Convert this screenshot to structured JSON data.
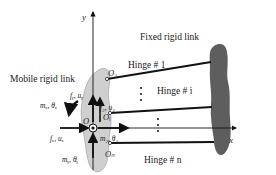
{
  "labels": {
    "mobile_link": "Mobile rigid link",
    "fixed_link": "Fixed rigid link",
    "hinge_1": "Hinge # 1",
    "hinge_i": "Hinge # i",
    "hinge_n": "Hinge # n",
    "axis_x": "x",
    "axis_y": "y",
    "origin": "O",
    "point_o1": "O₁",
    "point_oi": "Oᵢ",
    "point_on": "Oₙ",
    "force_y": "fᵧ, uᵧ",
    "force_z": "f₂, u₂",
    "force_x": "fₓ, uₓ",
    "moment_x": "mₓ, θₓ",
    "moment_z": "m₂, θ₂",
    "moment_y": "mᵧ, θᵧ"
  },
  "colors": {
    "mobile_link_fill": "#cfcfcf",
    "fixed_link_fill": "#5e5e5e",
    "line": "#111111"
  }
}
